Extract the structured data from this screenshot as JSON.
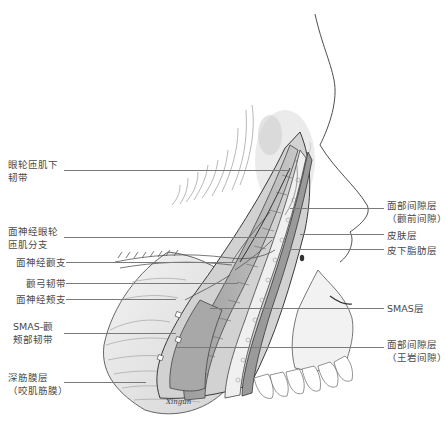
{
  "figure": {
    "type": "anatomical-illustration",
    "signature": "Xingun"
  },
  "labels_left": [
    {
      "id": "l1",
      "lines": [
        "眼轮匝肌下",
        "韧带"
      ],
      "text_y": 158,
      "line_y": 170
    },
    {
      "id": "l2",
      "lines": [
        "面神经眼轮",
        "匝肌分支"
      ],
      "text_y": 225,
      "line_y": 237
    },
    {
      "id": "l3",
      "lines": [
        "面神经颧支"
      ],
      "text_y": 256,
      "line_y": 262
    },
    {
      "id": "l4",
      "lines": [
        "颧弓韧带"
      ],
      "text_y": 277,
      "line_y": 283
    },
    {
      "id": "l5",
      "lines": [
        "面神经颊支"
      ],
      "text_y": 293,
      "line_y": 299
    },
    {
      "id": "l6",
      "lines": [
        "SMAS-颧",
        "颊部韧带"
      ],
      "text_y": 320,
      "line_y": 333
    },
    {
      "id": "l7",
      "lines": [
        "深筋膜层",
        "（咬肌筋膜）"
      ],
      "text_y": 371,
      "line_y": 382
    }
  ],
  "labels_right": [
    {
      "id": "r1",
      "lines": [
        "面部间隙层",
        "（颧前间隙）"
      ],
      "text_y": 199,
      "line_y": 208
    },
    {
      "id": "r2",
      "lines": [
        "皮肤层"
      ],
      "text_y": 229,
      "line_y": 234
    },
    {
      "id": "r3",
      "lines": [
        "皮下脂肪层"
      ],
      "text_y": 244,
      "line_y": 249
    },
    {
      "id": "r4",
      "lines": [
        "SMAS层"
      ],
      "text_y": 302,
      "line_y": 308
    },
    {
      "id": "r5",
      "lines": [
        "面部间隙层",
        "（王岩间隙）"
      ],
      "text_y": 338,
      "line_y": 347
    }
  ],
  "colors": {
    "background": "#ffffff",
    "label_text": "#4a4a4a",
    "leader_line": "#7a7a7a",
    "outline": "#3a3a3a",
    "shade_light": "#e4e4e4",
    "shade_mid": "#bdbdbd",
    "shade_dark": "#8a8a8a"
  }
}
